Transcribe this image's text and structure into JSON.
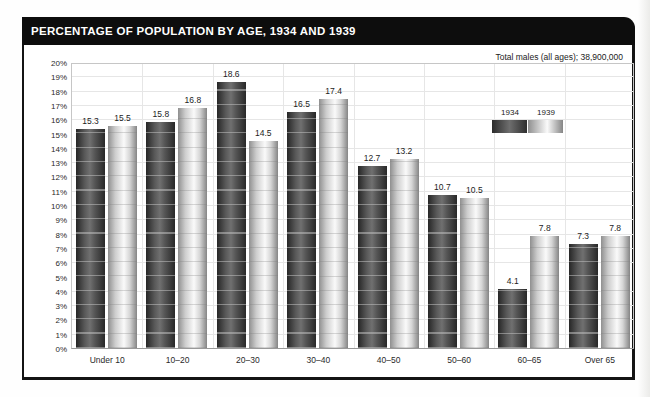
{
  "title": "PERCENTAGE OF POPULATION BY AGE, 1934 AND 1939",
  "subtitle": "Total males (all ages); 38,900,000",
  "legend": {
    "items": [
      {
        "label": "1934"
      },
      {
        "label": "1939"
      }
    ]
  },
  "colors": {
    "title_bar_bg": "#0d0d0d",
    "title_text": "#ffffff",
    "bar_1934_dark": "#3c3c3c",
    "bar_1939_light": "#e8e8e8",
    "gridline": "#e6e6e6",
    "panel_border": "#141414"
  },
  "chart_data": {
    "type": "bar",
    "title": "PERCENTAGE OF POPULATION BY AGE, 1934 AND 1939",
    "annotation": "Total males (all ages); 38,900,000",
    "categories": [
      "Under 10",
      "10–20",
      "20–30",
      "30–40",
      "40–50",
      "50–60",
      "60–65",
      "Over 65"
    ],
    "series": [
      {
        "name": "1934",
        "values": [
          15.3,
          15.8,
          18.6,
          16.5,
          12.7,
          10.7,
          4.1,
          7.3
        ]
      },
      {
        "name": "1939",
        "values": [
          15.5,
          16.8,
          14.5,
          17.4,
          13.2,
          10.5,
          7.8,
          7.8
        ]
      }
    ],
    "xlabel": "",
    "ylabel": "",
    "ylim": [
      0,
      20
    ],
    "ytick_step": 1,
    "ytick_suffix": "%",
    "grid": true,
    "legend_position": "upper right"
  }
}
